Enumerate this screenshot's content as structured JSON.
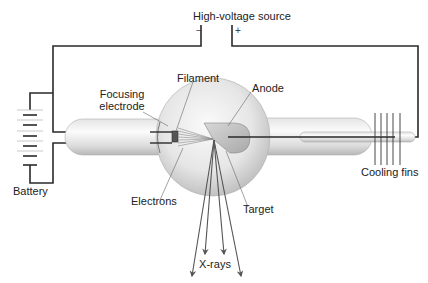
{
  "labels": {
    "high_voltage_source": "High-voltage source",
    "minus": "−",
    "plus": "+",
    "filament": "Filament",
    "focusing_electrode_line1": "Focusing",
    "focusing_electrode_line2": "electrode",
    "anode": "Anode",
    "battery": "Battery",
    "electrons": "Electrons",
    "target": "Target",
    "cooling_fins": "Cooling fins",
    "x_rays": "X-rays"
  },
  "colors": {
    "wire": "#2a2a2a",
    "glass_light": "#f4f4f4",
    "glass_dark": "#bdbdbd",
    "leader_line": "#555555",
    "arrow": "#555555",
    "text": "#222222"
  }
}
